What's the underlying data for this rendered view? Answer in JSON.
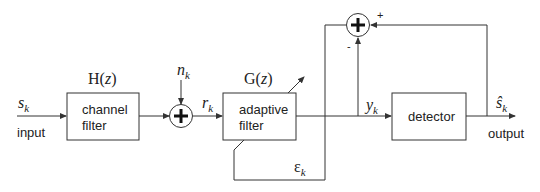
{
  "diagram": {
    "type": "block-diagram",
    "signals": {
      "input_symbol": "s",
      "input_sub": "k",
      "input_label": "input",
      "noise_symbol": "n",
      "noise_sub": "k",
      "received_symbol": "r",
      "received_sub": "k",
      "equalized_symbol": "y",
      "equalized_sub": "k",
      "estimate_symbol": "ŝ",
      "estimate_sub": "k",
      "output_label": "output",
      "error_symbol": "ε",
      "error_sub": "k"
    },
    "blocks": {
      "channel": {
        "transfer": "H(z)",
        "line1": "channel",
        "line2": "filter"
      },
      "adaptive": {
        "transfer": "G(z)",
        "line1": "adaptive",
        "line2": "filter"
      },
      "detector": {
        "label": "detector"
      }
    },
    "summers": {
      "noise_sum": {
        "symbol": "+"
      },
      "error_sum": {
        "symbol": "+",
        "plus_sign": "+",
        "minus_sign": "-"
      }
    }
  }
}
